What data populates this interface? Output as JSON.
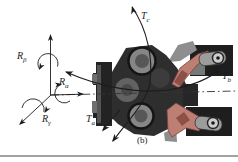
{
  "figure": {
    "panel_label": "(b)"
  },
  "labels": {
    "torque_c": {
      "main": "T",
      "sub": "c"
    },
    "torque_b": {
      "main": "T",
      "sub": "b"
    },
    "torque_a": {
      "main": "T",
      "sub": "a"
    },
    "reaction_beta": {
      "main": "R",
      "sub": "β"
    },
    "reaction_alpha": {
      "main": "R",
      "sub": "α"
    },
    "reaction_gamma": {
      "main": "R",
      "sub": "γ"
    }
  },
  "colors": {
    "line": "#1c1c1c",
    "housing_dark": "#2e2e2e",
    "flange_dark": "#232323",
    "knob_gray": "#868686",
    "knob_inner": "#575757",
    "hub_gray": "#626262",
    "arm_pink": "#bd7e73",
    "arm_shadow": "#8e4f47",
    "link_gray": "#9c9c9c",
    "pivot_light": "#cdcdcd",
    "block_dark": "#1e1e1e",
    "wedge_gray": "#8e8e8e",
    "bottom_rule": "#a2a2a2",
    "background": "#ffffff"
  }
}
